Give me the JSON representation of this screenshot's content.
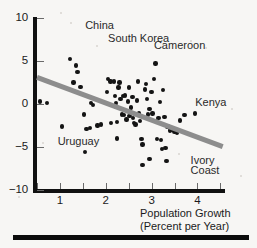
{
  "chart_data": {
    "type": "scatter",
    "title": "",
    "xlabel": "Population Growth\n(Percent per Year)",
    "xlabel_line1": "Population Growth",
    "xlabel_line2": "(Percent per Year)",
    "ylabel": "",
    "xlim": [
      0.5,
      4.6
    ],
    "ylim": [
      -10,
      10
    ],
    "xticks": [
      1,
      2,
      3,
      4
    ],
    "xticklabels": [
      "1",
      "2",
      "3",
      "4"
    ],
    "xminorticks": [
      0.5,
      1.5,
      2.5,
      3.5,
      4.5
    ],
    "yticks": [
      10,
      5,
      0,
      -5,
      -10
    ],
    "yticklabels": [
      "10",
      "5",
      "0",
      "−5",
      "−10"
    ],
    "grid": false,
    "legend": false,
    "series": [
      {
        "name": "Countries",
        "marker": "filled-circle",
        "color": "#141414",
        "points": [
          [
            0.57,
            0.3
          ],
          [
            0.72,
            0.1
          ],
          [
            1.05,
            -2.6
          ],
          [
            1.22,
            5.2
          ],
          [
            1.3,
            2.5
          ],
          [
            1.35,
            4.5
          ],
          [
            1.38,
            3.7
          ],
          [
            1.45,
            2.0
          ],
          [
            1.52,
            -1.2
          ],
          [
            1.55,
            -5.6
          ],
          [
            1.58,
            -2.9
          ],
          [
            1.65,
            -2.8
          ],
          [
            1.68,
            0.1
          ],
          [
            1.72,
            -0.1
          ],
          [
            1.82,
            -2.5
          ],
          [
            1.9,
            -2.4
          ],
          [
            2.02,
            1.4
          ],
          [
            2.05,
            2.9
          ],
          [
            2.1,
            2.6
          ],
          [
            2.12,
            -2.2
          ],
          [
            2.18,
            2.6
          ],
          [
            2.2,
            0.9
          ],
          [
            2.22,
            0.1
          ],
          [
            2.22,
            -0.3
          ],
          [
            2.25,
            -2.1
          ],
          [
            2.25,
            -4.0
          ],
          [
            2.28,
            1.9
          ],
          [
            2.3,
            2.5
          ],
          [
            2.32,
            0.6
          ],
          [
            2.35,
            -1.2
          ],
          [
            2.38,
            0.9
          ],
          [
            2.4,
            -1.3
          ],
          [
            2.42,
            1.0
          ],
          [
            2.45,
            -1.8
          ],
          [
            2.48,
            0.3
          ],
          [
            2.5,
            1.9
          ],
          [
            2.52,
            -1.4
          ],
          [
            2.55,
            -0.4
          ],
          [
            2.58,
            0.8
          ],
          [
            2.6,
            -1.6
          ],
          [
            2.62,
            -2.2
          ],
          [
            2.65,
            -2.4
          ],
          [
            2.68,
            0.4
          ],
          [
            2.7,
            2.6
          ],
          [
            2.72,
            -1.1
          ],
          [
            2.75,
            -2.0
          ],
          [
            2.78,
            -4.1
          ],
          [
            2.8,
            -4.7
          ],
          [
            2.8,
            -7.1
          ],
          [
            2.85,
            1.7
          ],
          [
            2.88,
            2.3
          ],
          [
            2.9,
            0.6
          ],
          [
            2.92,
            -1.2
          ],
          [
            2.95,
            -0.6
          ],
          [
            2.95,
            -6.4
          ],
          [
            3.0,
            1.4
          ],
          [
            3.02,
            -1.1
          ],
          [
            3.05,
            2.9
          ],
          [
            3.08,
            4.7
          ],
          [
            3.1,
            -2.0
          ],
          [
            3.12,
            -4.1
          ],
          [
            3.15,
            -1.6
          ],
          [
            3.18,
            0.2
          ],
          [
            3.2,
            -4.2
          ],
          [
            3.22,
            -5.2
          ],
          [
            3.25,
            1.6
          ],
          [
            3.28,
            -1.5
          ],
          [
            3.3,
            -5.1
          ],
          [
            3.32,
            -6.6
          ],
          [
            3.35,
            -2.6
          ],
          [
            3.4,
            -3.1
          ],
          [
            3.45,
            -3.0
          ],
          [
            3.5,
            -3.2
          ],
          [
            3.55,
            -3.3
          ],
          [
            3.62,
            -1.9
          ],
          [
            3.72,
            -1.3
          ],
          [
            3.95,
            -1.1
          ]
        ]
      }
    ],
    "trendline": {
      "name": "fitted regression line",
      "color": "#8d8d8d",
      "width_px": 5,
      "x_start": 0.5,
      "y_start": 3.1,
      "x_end": 4.55,
      "y_end": -4.95
    },
    "annotations": [
      {
        "text": "China",
        "x": 1.55,
        "y": 9.1,
        "name": "china"
      },
      {
        "text": "South Korea",
        "x": 2.05,
        "y": 7.6,
        "name": "south-korea"
      },
      {
        "text": "Cameroon",
        "x": 3.05,
        "y": 6.7,
        "name": "cameroon"
      },
      {
        "text": "Kenya",
        "x": 3.95,
        "y": 0.1,
        "name": "kenya"
      },
      {
        "text": "Uruguay",
        "x": 0.95,
        "y": -4.4,
        "name": "uruguay"
      },
      {
        "text": "Ivory",
        "x": 3.85,
        "y": -6.6,
        "name": "ivory"
      },
      {
        "text": "Coast",
        "x": 3.85,
        "y": -7.8,
        "name": "coast"
      }
    ]
  },
  "axis": {
    "x_title_line1": "Population Growth",
    "x_title_line2": "(Percent per Year)"
  }
}
